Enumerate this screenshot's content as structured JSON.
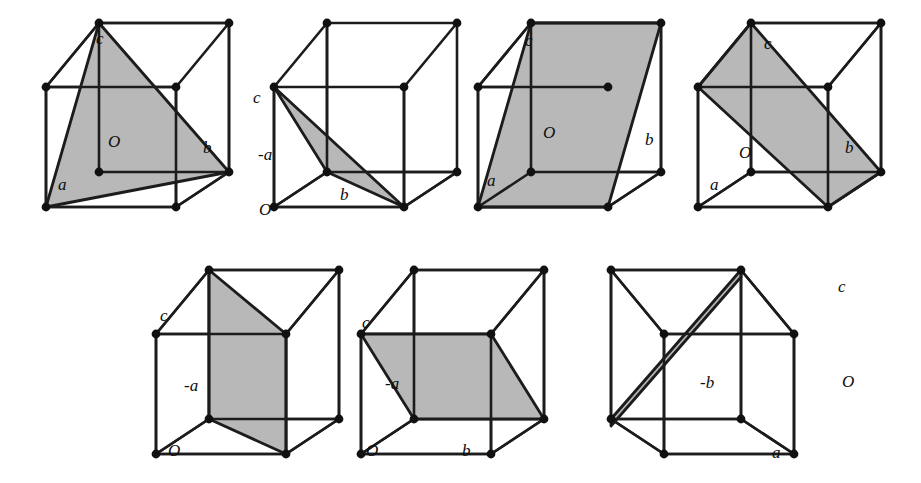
{
  "figure": {
    "background_color": "#ffffff",
    "edge_color": "#1c1c1c",
    "plane_fill_color": "#b8b8b8",
    "vertex_color": "#111111",
    "label_color": "#0d0d0d",
    "row_count": 2,
    "panel_count": 7
  },
  "panels": [
    {
      "id": "panel-1",
      "row": 1,
      "index": 1,
      "plane_type": "triangle",
      "plane_description": "triangular plane cutting intercepts a, b, c",
      "labels": [
        {
          "name": "label-c",
          "text": "c",
          "x": 96,
          "y": 30
        },
        {
          "name": "label-O",
          "text": "O",
          "x": 108,
          "y": 133
        },
        {
          "name": "label-b",
          "text": "b",
          "x": 203,
          "y": 139
        },
        {
          "name": "label-a",
          "text": "a",
          "x": 58,
          "y": 176
        }
      ]
    },
    {
      "id": "panel-2",
      "row": 1,
      "index": 2,
      "plane_type": "thin-triangle",
      "plane_description": "narrow sliver plane through c, -a and b",
      "labels": [
        {
          "name": "label-c",
          "text": "c",
          "x": 253,
          "y": 89
        },
        {
          "name": "label-minus-a",
          "text": "-a",
          "x": 258,
          "y": 146
        },
        {
          "name": "label-b",
          "text": "b",
          "x": 340,
          "y": 186
        },
        {
          "name": "label-O",
          "text": "O",
          "x": 259,
          "y": 201
        }
      ]
    },
    {
      "id": "panel-3",
      "row": 1,
      "index": 3,
      "plane_type": "parallelogram",
      "plane_description": "large parallelogram plane through a and c, parallel to b",
      "labels": [
        {
          "name": "label-c",
          "text": "c",
          "x": 525,
          "y": 32
        },
        {
          "name": "label-O",
          "text": "O",
          "x": 543,
          "y": 124
        },
        {
          "name": "label-b",
          "text": "b",
          "x": 645,
          "y": 131
        },
        {
          "name": "label-a",
          "text": "a",
          "x": 487,
          "y": 172
        }
      ]
    },
    {
      "id": "panel-4",
      "row": 1,
      "index": 4,
      "plane_type": "diagonal-parallelogram",
      "plane_description": "diagonal band plane through c and b",
      "labels": [
        {
          "name": "label-c",
          "text": "c",
          "x": 764,
          "y": 35
        },
        {
          "name": "label-O",
          "text": "O",
          "x": 739,
          "y": 144
        },
        {
          "name": "label-b",
          "text": "b",
          "x": 845,
          "y": 139
        },
        {
          "name": "label-a",
          "text": "a",
          "x": 710,
          "y": 176
        }
      ]
    },
    {
      "id": "panel-5",
      "row": 2,
      "index": 5,
      "plane_type": "vertical-slab",
      "plane_description": "vertical plane through -a parallel to c",
      "labels": [
        {
          "name": "label-c",
          "text": "c",
          "x": 160,
          "y": 307
        },
        {
          "name": "label-minus-a",
          "text": "-a",
          "x": 184,
          "y": 377
        },
        {
          "name": "label-O",
          "text": "O",
          "x": 168,
          "y": 442
        }
      ]
    },
    {
      "id": "panel-6",
      "row": 2,
      "index": 6,
      "plane_type": "horizontal-parallelogram",
      "plane_description": "plane through c and -a parallel to b",
      "labels": [
        {
          "name": "label-c",
          "text": "c",
          "x": 362,
          "y": 314
        },
        {
          "name": "label-minus-a",
          "text": "-a",
          "x": 385,
          "y": 375
        },
        {
          "name": "label-O",
          "text": "O",
          "x": 366,
          "y": 442
        },
        {
          "name": "label-b",
          "text": "b",
          "x": 462,
          "y": 442
        }
      ]
    },
    {
      "id": "panel-7",
      "row": 2,
      "index": 7,
      "plane_type": "thin-sliver",
      "plane_description": "very narrow sliver plane through -b and c",
      "labels": [
        {
          "name": "label-c",
          "text": "c",
          "x": 838,
          "y": 278
        },
        {
          "name": "label-minus-b",
          "text": "-b",
          "x": 700,
          "y": 374
        },
        {
          "name": "label-O",
          "text": "O",
          "x": 842,
          "y": 373
        },
        {
          "name": "label-a",
          "text": "a",
          "x": 772,
          "y": 444
        }
      ]
    }
  ],
  "geometry": {
    "cube_1": {
      "front_bottom_left": [
        46,
        207
      ],
      "front_bottom_right": [
        176,
        207
      ],
      "front_top_left": [
        46,
        87
      ],
      "front_top_right": [
        176,
        87
      ],
      "back_bottom_left": [
        99,
        172
      ],
      "back_bottom_right": [
        229,
        172
      ],
      "back_top_left": [
        99,
        23
      ],
      "back_top_right": [
        229,
        23
      ]
    }
  }
}
